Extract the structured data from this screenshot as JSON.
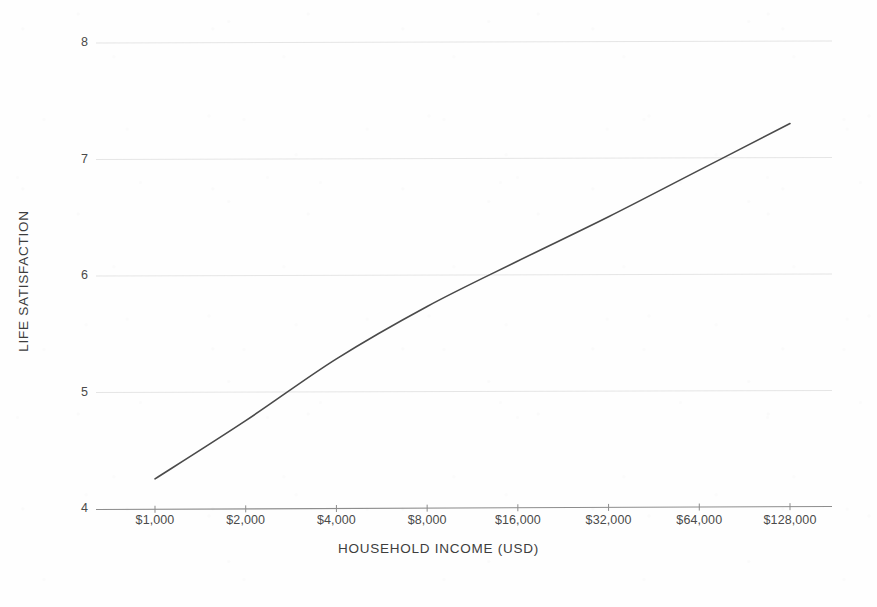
{
  "chart_data": {
    "type": "line",
    "title": "",
    "subtitle": "",
    "xlabel": "HOUSEHOLD INCOME (USD)",
    "ylabel": "LIFE SATISFACTION",
    "x_scale": "log2",
    "xlim": [
      1000,
      128000
    ],
    "ylim": [
      4,
      8
    ],
    "grid": true,
    "legend": null,
    "x_tick_labels": [
      "$1,000",
      "$2,000",
      "$4,000",
      "$8,000",
      "$16,000",
      "$32,000",
      "$64,000",
      "$128,000"
    ],
    "x_tick_values": [
      1000,
      2000,
      4000,
      8000,
      16000,
      32000,
      64000,
      128000
    ],
    "y_tick_labels": [
      "8",
      "7",
      "6",
      "5",
      "4"
    ],
    "y_tick_values": [
      8,
      7,
      6,
      5,
      4
    ],
    "series": [
      {
        "name": "Life satisfaction",
        "color": "#4a4a4a",
        "x": [
          1000,
          2000,
          4000,
          8000,
          16000,
          32000,
          64000,
          128000
        ],
        "values": [
          4.25,
          4.75,
          5.28,
          5.73,
          6.12,
          6.5,
          6.9,
          7.3
        ]
      }
    ]
  },
  "axes": {
    "x_title": "HOUSEHOLD INCOME (USD)",
    "y_title": "LIFE SATISFACTION"
  },
  "colors": {
    "curve": "#4a4a4a",
    "gridline": "#e2e2e2",
    "axis": "#8d8d8d",
    "background": "#fefefe",
    "text": "#4a4a4a"
  }
}
